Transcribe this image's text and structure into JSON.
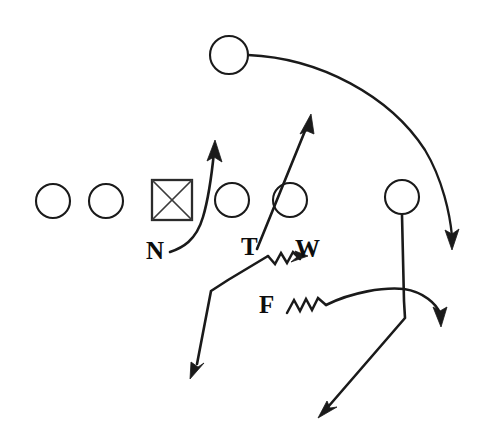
{
  "diagram": {
    "canvas": {
      "width": 484,
      "height": 442
    },
    "colors": {
      "background": "#ffffff",
      "stroke": "#1a1a1a",
      "label": "#0d0d0d"
    },
    "labels": [
      {
        "id": "nose",
        "text": "N",
        "x": 146,
        "y": 238,
        "description": "nose-tackle-label"
      },
      {
        "id": "tackle",
        "text": "T",
        "x": 241,
        "y": 234,
        "description": "tackle-label"
      },
      {
        "id": "will",
        "text": "W",
        "x": 295,
        "y": 236,
        "description": "will-linebacker-label"
      },
      {
        "id": "free",
        "text": "F",
        "x": 259,
        "y": 292,
        "description": "free-safety-label"
      }
    ],
    "players": [
      {
        "id": "ol-1",
        "shape": "circle",
        "cx": 53,
        "cy": 201,
        "r": 17,
        "role": "offensive-lineman"
      },
      {
        "id": "ol-2",
        "shape": "circle",
        "cx": 106,
        "cy": 201,
        "r": 17,
        "role": "offensive-lineman"
      },
      {
        "id": "center",
        "shape": "square-x",
        "x": 152,
        "y": 180,
        "size": 40,
        "role": "center"
      },
      {
        "id": "ol-3",
        "shape": "circle",
        "cx": 232,
        "cy": 200,
        "r": 17,
        "role": "offensive-lineman"
      },
      {
        "id": "ol-4",
        "shape": "circle",
        "cx": 290,
        "cy": 200,
        "r": 17,
        "role": "offensive-lineman"
      },
      {
        "id": "back-top",
        "shape": "circle",
        "cx": 229,
        "cy": 55,
        "r": 19,
        "role": "deep-back"
      },
      {
        "id": "back-right",
        "shape": "circle",
        "cx": 402,
        "cy": 197,
        "r": 17,
        "role": "wide-back"
      }
    ],
    "routes": [
      {
        "id": "nose-stunt",
        "label": "N",
        "type": "curve-arrow",
        "description": "nose tackle curls right then up through gap",
        "path": "M 170 252 C 182 248 196 240 203 216 C 209 196 212 172 214 152",
        "arrow": {
          "x": 214,
          "y": 142,
          "angle": -83
        }
      },
      {
        "id": "tackle-slant",
        "label": "T",
        "type": "straight-arrow",
        "description": "tackle slants up and to the right through the circle",
        "path": "M 257 248 L 308 124",
        "arrow": {
          "x": 310,
          "y": 116,
          "angle": -67
        }
      },
      {
        "id": "will-blitz",
        "label": "W",
        "type": "blitz-zigzag-arrow",
        "description": "Will linebacker zigzag blitz then drops down-left",
        "zigzag": "M 302 259 L 293 253 L 287 263 L 281 254 L 275 264 L 268 257",
        "path": "M 268 257 L 227 281 L 211 291 L 196 366",
        "arrow": {
          "x": 191,
          "y": 376,
          "angle": 101
        },
        "arrow_tail": {
          "x": 305,
          "y": 258,
          "angle": -20
        }
      },
      {
        "id": "free-blitz",
        "label": "F",
        "type": "blitz-zigzag-curve-arrow",
        "description": "Free safety zigzag blitz sweeping right then curving down",
        "zigzag": "M 287 312 L 294 300 L 300 311 L 306 299 L 312 310 L 318 298 L 325 306",
        "path": "M 325 306 C 352 292 384 288 404 290 C 424 293 436 305 440 314",
        "arrow": {
          "x": 441,
          "y": 324,
          "angle": 75
        }
      },
      {
        "id": "back-right-drop",
        "type": "straight-arrow",
        "description": "right back drops straight down then angles down-left",
        "path": "M 402 216 L 404 300 L 405 318 L 326 409",
        "arrow": {
          "x": 319,
          "y": 416,
          "angle": 130
        }
      },
      {
        "id": "deep-back-sweep",
        "type": "long-curve-arrow",
        "description": "deep back sweeps in a wide arc right and down",
        "path": "M 248 55 C 320 58 390 96 425 150 C 443 180 450 215 452 236",
        "arrow": {
          "x": 452,
          "y": 246,
          "angle": 84
        }
      }
    ]
  }
}
